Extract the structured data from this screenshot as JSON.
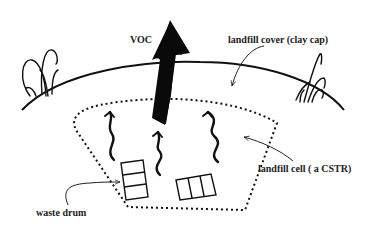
{
  "diagram": {
    "labels": {
      "voc": "VOC",
      "cover": "landfill cover (clay cap)",
      "cell": "landfill cell ( a CSTR)",
      "drum": "waste drum"
    },
    "elements": {
      "cover_line": "solid curved arc representing clay cap",
      "cell_boundary": "dotted trapezoid representing landfill cell",
      "big_arrow": "thick black arrow labeled VOC crossing the cover upward",
      "wavy_arrows": 3,
      "waste_drums": 2,
      "grass_tufts": 2
    },
    "colors": {
      "ink": "#111111",
      "background": "#ffffff"
    }
  }
}
